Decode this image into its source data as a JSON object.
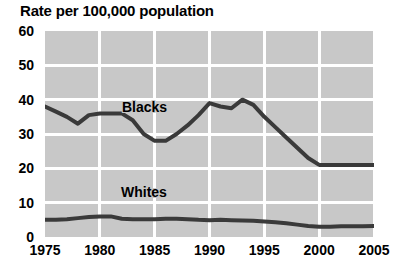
{
  "chart_data": {
    "type": "line",
    "title": "Rate per 100,000 population",
    "xlabel": "",
    "ylabel": "",
    "xlim": [
      1975,
      2005
    ],
    "ylim": [
      0,
      60
    ],
    "ytick_labels": [
      "60",
      "50",
      "40",
      "30",
      "20",
      "10",
      "0"
    ],
    "ytick_values": [
      60,
      50,
      40,
      30,
      20,
      10,
      0
    ],
    "xtick_labels": [
      "1975",
      "1980",
      "1985",
      "1990",
      "1995",
      "2000",
      "2005"
    ],
    "xtick_values": [
      1975,
      1980,
      1985,
      1990,
      1995,
      2000,
      2005
    ],
    "grid": true,
    "legend_position": "inline",
    "plot_background": "#c8c8c8",
    "gridline_color": "#ffffff",
    "line_color": "#3a3a3a",
    "x": [
      1975,
      1976,
      1977,
      1978,
      1979,
      1980,
      1981,
      1982,
      1983,
      1984,
      1985,
      1986,
      1987,
      1988,
      1989,
      1990,
      1991,
      1992,
      1993,
      1994,
      1995,
      1996,
      1997,
      1998,
      1999,
      2000,
      2001,
      2002,
      2003,
      2004,
      2005
    ],
    "series": [
      {
        "name": "Blacks",
        "color": "#3a3a3a",
        "values": [
          38.0,
          36.5,
          35.0,
          33.0,
          35.5,
          36.0,
          36.0,
          36.0,
          34.0,
          30.0,
          28.0,
          28.0,
          30.0,
          32.5,
          35.5,
          39.0,
          38.0,
          37.5,
          40.0,
          38.5,
          35.0,
          32.0,
          29.0,
          26.0,
          23.0,
          21.0,
          21.0,
          21.0,
          21.0,
          21.0,
          21.0
        ]
      },
      {
        "name": "Whites",
        "color": "#3a3a3a",
        "values": [
          5.0,
          5.0,
          5.2,
          5.5,
          5.8,
          6.0,
          6.0,
          5.3,
          5.2,
          5.2,
          5.2,
          5.3,
          5.3,
          5.2,
          5.0,
          4.9,
          5.0,
          4.9,
          4.8,
          4.7,
          4.5,
          4.3,
          4.0,
          3.6,
          3.2,
          3.0,
          3.0,
          3.1,
          3.1,
          3.1,
          3.2
        ]
      }
    ],
    "annotations": [
      {
        "text": "Blacks",
        "series": "Blacks"
      },
      {
        "text": "Whites",
        "series": "Whites"
      }
    ]
  }
}
